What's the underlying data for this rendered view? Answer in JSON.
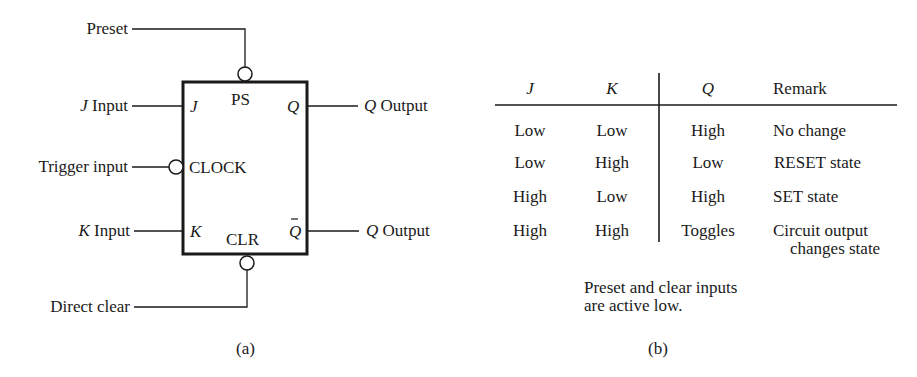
{
  "diagram_a": {
    "caption": "(a)",
    "box": {
      "top_label": "PS",
      "bottom_label": "CLR"
    },
    "pins": {
      "j": {
        "external": "Input",
        "external_var": "J",
        "internal": "J"
      },
      "clock": {
        "external": "Trigger input",
        "internal": "CLOCK"
      },
      "k": {
        "external": "Input",
        "external_var": "K",
        "internal": "K"
      },
      "q": {
        "external": "Output",
        "external_var": "Q",
        "internal": "Q"
      },
      "q_bar": {
        "external": "Output",
        "external_var": "Q",
        "internal": "Q̄"
      },
      "preset": {
        "external": "Preset"
      },
      "clear": {
        "external": "Direct clear"
      }
    }
  },
  "table_b": {
    "caption": "(b)",
    "headers": [
      "J",
      "K",
      "Q",
      "Remark"
    ],
    "rows": [
      {
        "j": "Low",
        "k": "Low",
        "q": "High",
        "remark": "No change",
        "remark2": ""
      },
      {
        "j": "Low",
        "k": "High",
        "q": "Low",
        "remark": "RESET state",
        "remark2": ""
      },
      {
        "j": "High",
        "k": "Low",
        "q": "High",
        "remark": "SET state",
        "remark2": ""
      },
      {
        "j": "High",
        "k": "High",
        "q": "Toggles",
        "remark": "Circuit output",
        "remark2": "changes state"
      }
    ],
    "note_line1": "Preset and clear inputs",
    "note_line2": "are active low."
  }
}
